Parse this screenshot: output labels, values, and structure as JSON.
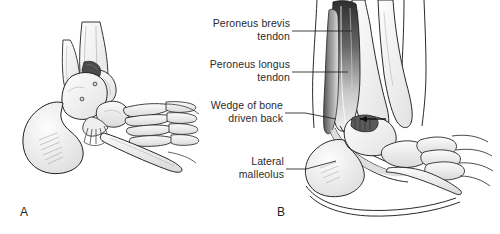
{
  "figure": {
    "background_color": "#ffffff",
    "ink_color": "#1f1f1f",
    "label_color": "#2b2b2b",
    "bone_fill": "#f4f4f4",
    "shadow_fill": "#5a5a5a",
    "tendon_dark": "#3a3a3a"
  },
  "labels": [
    {
      "id": "peroneus-brevis-tendon",
      "line1": "Peroneus brevis",
      "line2": "tendon"
    },
    {
      "id": "peroneus-longus-tendon",
      "line1": "Peroneus longus",
      "line2": "tendon"
    },
    {
      "id": "wedge-of-bone",
      "line1": "Wedge of bone",
      "line2": "driven back"
    },
    {
      "id": "lateral-malleolus",
      "line1": "Lateral",
      "line2": "malleolus"
    }
  ],
  "panels": [
    {
      "id": "panel-a",
      "letter": "A",
      "view": "dorsolateral view of foot and ankle skeleton"
    },
    {
      "id": "panel-b",
      "letter": "B",
      "view": "lateral view of leg, ankle and foot with peroneal tendons"
    }
  ],
  "margin_note": "O U I H T S E R R A M   Y"
}
